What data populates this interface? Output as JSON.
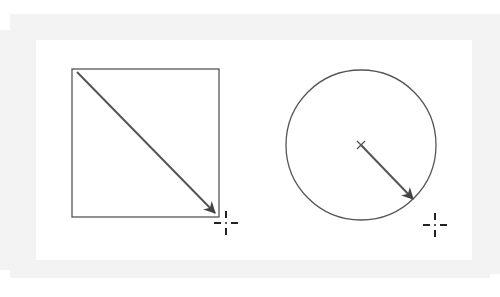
{
  "diagram": {
    "background": "#ffffff",
    "frame_color": "#f3f3f3",
    "stroke_color": "#555555",
    "cursor_color": "#222222",
    "figures": [
      {
        "id": "rectangle-figure",
        "shape": "rectangle",
        "x": 72,
        "y": 69,
        "width": 147,
        "height": 148,
        "arrow": {
          "from": [
            77,
            72
          ],
          "to": [
            215,
            213
          ],
          "kind": "diagonal"
        },
        "cursor": {
          "x": 226,
          "y": 223
        }
      },
      {
        "id": "circle-figure",
        "shape": "circle",
        "cx": 361,
        "cy": 145,
        "r": 75,
        "center_mark": "x",
        "arrow": {
          "from": [
            361,
            145
          ],
          "to": [
            413,
            199
          ],
          "kind": "radius"
        },
        "cursor": {
          "x": 435,
          "y": 225
        }
      }
    ]
  }
}
